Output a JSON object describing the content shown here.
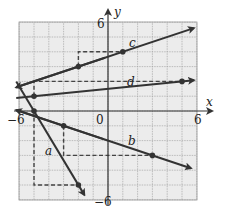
{
  "chart_data": {
    "type": "line",
    "title": "",
    "xlabel": "x",
    "ylabel": "y",
    "xlim": [
      -6,
      6
    ],
    "ylim": [
      -6,
      6
    ],
    "grid": true,
    "tick_labels": {
      "x": [
        "-6",
        "0",
        "6"
      ],
      "y": [
        "6",
        "-6"
      ]
    },
    "series": [
      {
        "name": "a",
        "points": [
          [
            -5,
            0
          ],
          [
            -2,
            -5
          ]
        ],
        "slope": "-5/3",
        "rise_run_guide": true
      },
      {
        "name": "b",
        "points": [
          [
            -3,
            -1
          ],
          [
            3,
            -3
          ]
        ],
        "slope": "-1/3",
        "rise_run_guide": true
      },
      {
        "name": "c",
        "points": [
          [
            -2,
            3
          ],
          [
            1,
            4
          ]
        ],
        "slope": "1/3",
        "rise_run_guide": true
      },
      {
        "name": "d",
        "points": [
          [
            -5,
            1
          ],
          [
            5,
            2
          ]
        ],
        "slope": "1/10",
        "rise_run_guide": true
      }
    ]
  },
  "labels": {
    "x_axis": "x",
    "y_axis": "y",
    "x_min": "−6",
    "x_origin": "0",
    "x_max": "6",
    "y_max": "6",
    "y_min": "−6",
    "line_a": "a",
    "line_b": "b",
    "line_c": "c",
    "line_d": "d"
  }
}
